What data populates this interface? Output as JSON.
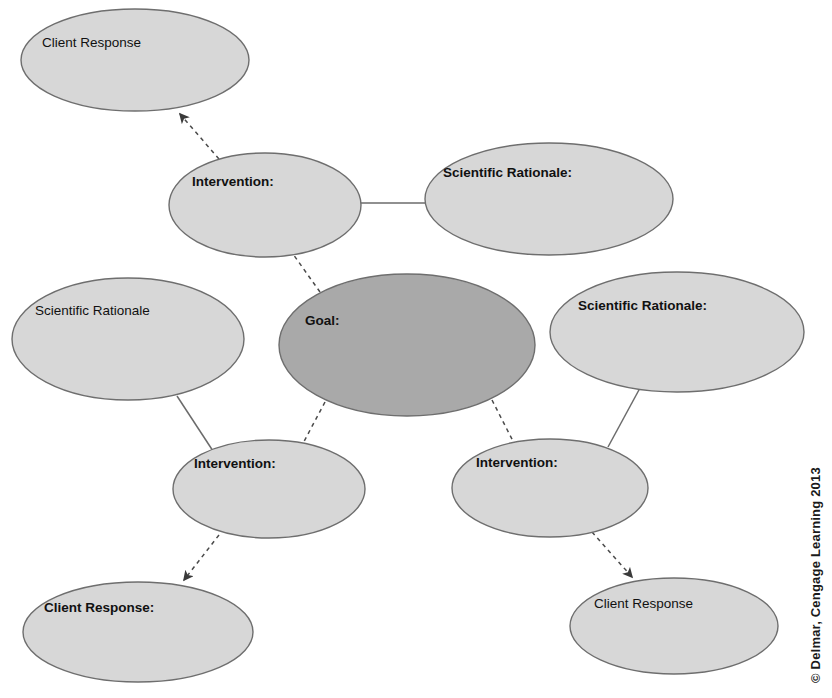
{
  "page": {
    "background_color": "#ffffff",
    "width": 832,
    "height": 698
  },
  "colors": {
    "node_fill_light": "#d7d7d7",
    "node_fill_dark": "#a9a9a9",
    "node_stroke": "#6e6e6e",
    "link_solid": "#6b6b6b",
    "link_dashed": "#4a4a4a",
    "text": "#111111"
  },
  "nodes": [
    {
      "id": "client-response-top-left",
      "label": "Client Response",
      "role": "client-response",
      "shade": "light",
      "bold": false,
      "cx": 135,
      "cy": 60,
      "rx": 114,
      "ry": 51,
      "label_x": 42,
      "label_y": 43
    },
    {
      "id": "intervention-top",
      "label": "Intervention:",
      "role": "intervention",
      "shade": "light",
      "bold": true,
      "cx": 265,
      "cy": 205,
      "rx": 96,
      "ry": 52,
      "label_x": 192,
      "label_y": 182
    },
    {
      "id": "scientific-rationale-top-right",
      "label": "Scientific Rationale:",
      "role": "scientific-rationale",
      "shade": "light",
      "bold": true,
      "cx": 549,
      "cy": 199,
      "rx": 124,
      "ry": 56,
      "label_x": 443,
      "label_y": 173
    },
    {
      "id": "scientific-rationale-left",
      "label": "Scientific Rationale",
      "role": "scientific-rationale",
      "shade": "light",
      "bold": false,
      "cx": 128,
      "cy": 339,
      "rx": 116,
      "ry": 61,
      "label_x": 35,
      "label_y": 311
    },
    {
      "id": "goal-center",
      "label": "Goal:",
      "role": "goal",
      "shade": "dark",
      "bold": true,
      "cx": 407,
      "cy": 345,
      "rx": 128,
      "ry": 71,
      "label_x": 305,
      "label_y": 321
    },
    {
      "id": "scientific-rationale-right",
      "label": "Scientific Rationale:",
      "role": "scientific-rationale",
      "shade": "light",
      "bold": true,
      "cx": 677,
      "cy": 332,
      "rx": 127,
      "ry": 60,
      "label_x": 578,
      "label_y": 306
    },
    {
      "id": "intervention-bottom-left",
      "label": "Intervention:",
      "role": "intervention",
      "shade": "light",
      "bold": true,
      "cx": 269,
      "cy": 489,
      "rx": 96,
      "ry": 49,
      "label_x": 194,
      "label_y": 464
    },
    {
      "id": "intervention-bottom-right",
      "label": "Intervention:",
      "role": "intervention",
      "shade": "light",
      "bold": true,
      "cx": 550,
      "cy": 488,
      "rx": 98,
      "ry": 49,
      "label_x": 476,
      "label_y": 463
    },
    {
      "id": "client-response-bottom-left",
      "label": "Client Response:",
      "role": "client-response",
      "shade": "light",
      "bold": true,
      "cx": 138,
      "cy": 632,
      "rx": 115,
      "ry": 50,
      "label_x": 44,
      "label_y": 608
    },
    {
      "id": "client-response-bottom-right",
      "label": "Client Response",
      "role": "client-response",
      "shade": "light",
      "bold": false,
      "cx": 674,
      "cy": 626,
      "rx": 104,
      "ry": 48,
      "label_x": 594,
      "label_y": 604
    }
  ],
  "connectors": [
    {
      "id": "link-intervention-top-to-rationale-top-right",
      "style": "solid",
      "arrow": false,
      "from": "intervention-top",
      "to": "scientific-rationale-top-right",
      "x1": 360,
      "y1": 203,
      "x2": 427,
      "y2": 203
    },
    {
      "id": "link-rationale-left-to-intervention-bottom-left",
      "style": "solid",
      "arrow": false,
      "from": "scientific-rationale-left",
      "to": "intervention-bottom-left",
      "x1": 177,
      "y1": 396,
      "x2": 213,
      "y2": 451
    },
    {
      "id": "link-rationale-right-to-intervention-bottom-right",
      "style": "solid",
      "arrow": false,
      "from": "scientific-rationale-right",
      "to": "intervention-bottom-right",
      "x1": 640,
      "y1": 388,
      "x2": 608,
      "y2": 447
    },
    {
      "id": "link-goal-to-intervention-top",
      "style": "dashed",
      "arrow": false,
      "from": "goal-center",
      "to": "intervention-top",
      "x1": 320,
      "y1": 292,
      "x2": 288,
      "y2": 247
    },
    {
      "id": "link-goal-to-intervention-bottom-left",
      "style": "dashed",
      "arrow": false,
      "from": "goal-center",
      "to": "intervention-bottom-left",
      "x1": 325,
      "y1": 402,
      "x2": 300,
      "y2": 449
    },
    {
      "id": "link-goal-to-intervention-bottom-right",
      "style": "dashed",
      "arrow": false,
      "from": "goal-center",
      "to": "intervention-bottom-right",
      "x1": 492,
      "y1": 400,
      "x2": 516,
      "y2": 447
    },
    {
      "id": "link-intervention-top-to-client-response-top-left",
      "style": "dashed",
      "arrow": true,
      "from": "intervention-top",
      "to": "client-response-top-left",
      "x1": 219,
      "y1": 159,
      "x2": 180,
      "y2": 114
    },
    {
      "id": "link-intervention-bottom-left-to-client-response-bottom-left",
      "style": "dashed",
      "arrow": true,
      "from": "intervention-bottom-left",
      "to": "client-response-bottom-left",
      "x1": 219,
      "y1": 535,
      "x2": 184,
      "y2": 580
    },
    {
      "id": "link-intervention-bottom-right-to-client-response-bottom-right",
      "style": "dashed",
      "arrow": true,
      "from": "intervention-bottom-right",
      "to": "client-response-bottom-right",
      "x1": 592,
      "y1": 532,
      "x2": 632,
      "y2": 577
    }
  ],
  "credit": {
    "text": "© Delmar, Cengage Learning 2013",
    "x": 820,
    "y": 683,
    "rotation": -90
  }
}
